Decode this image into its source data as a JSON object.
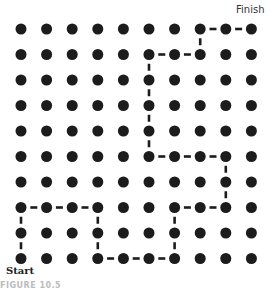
{
  "diagram": {
    "type": "grid-path",
    "rows": 10,
    "cols": 10,
    "labels": {
      "finish": "Finish",
      "start": "Start"
    },
    "caption": "FIGURE 10.5",
    "path": [
      [
        9,
        0
      ],
      [
        8,
        0
      ],
      [
        7,
        0
      ],
      [
        7,
        1
      ],
      [
        7,
        2
      ],
      [
        7,
        3
      ],
      [
        8,
        3
      ],
      [
        9,
        3
      ],
      [
        9,
        4
      ],
      [
        9,
        5
      ],
      [
        9,
        6
      ],
      [
        8,
        6
      ],
      [
        7,
        6
      ],
      [
        7,
        7
      ],
      [
        7,
        8
      ],
      [
        6,
        8
      ],
      [
        5,
        8
      ],
      [
        5,
        7
      ],
      [
        5,
        6
      ],
      [
        5,
        5
      ],
      [
        4,
        5
      ],
      [
        3,
        5
      ],
      [
        2,
        5
      ],
      [
        1,
        5
      ],
      [
        1,
        6
      ],
      [
        1,
        7
      ],
      [
        0,
        7
      ],
      [
        0,
        8
      ],
      [
        0,
        9
      ]
    ],
    "colors": {
      "dot": "#1c1c1c",
      "path": "#1c1c1c",
      "background": "#ffffff"
    }
  }
}
